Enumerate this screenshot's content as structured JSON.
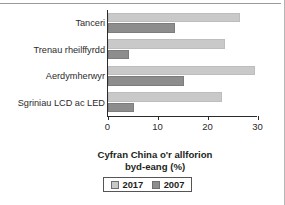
{
  "chart_data": {
    "type": "bar",
    "orientation": "horizontal",
    "title": "",
    "xlabel_lines": [
      "Cyfran China o'r allforion",
      "byd-eang (%)"
    ],
    "ylabel": "",
    "categories": [
      "Tanceri",
      "Trenau rheilffyrdd",
      "Aerdymherwyr",
      "Sgriniau LCD ac LED"
    ],
    "series": [
      {
        "name": "2017",
        "color": "#c9c9c9",
        "values": [
          26.5,
          23.5,
          29.5,
          22.8
        ]
      },
      {
        "name": "2007",
        "color": "#8d8d8d",
        "values": [
          13.5,
          4.2,
          15.2,
          5.2
        ]
      }
    ],
    "xlim": [
      0,
      30
    ],
    "xticks": [
      0,
      10,
      20,
      30
    ],
    "xtick_labels": [
      "0",
      "10",
      "20",
      "30"
    ],
    "grid": false,
    "legend_position": "bottom"
  },
  "legend": {
    "items": [
      {
        "label": "2017",
        "color": "#c9c9c9"
      },
      {
        "label": "2007",
        "color": "#8d8d8d"
      }
    ]
  },
  "colors": {
    "series_2017": "#c9c9c9",
    "series_2007": "#8d8d8d",
    "axis": "#2b2b2b",
    "text": "#231f20",
    "background": "#ffffff"
  }
}
